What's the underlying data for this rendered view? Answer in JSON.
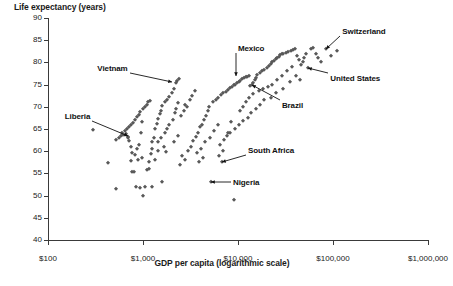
{
  "chart_data": {
    "type": "scatter",
    "title": "",
    "ylabel": "Life expectancy (years)",
    "xlabel": "GDP per capita (logarithmic scale)",
    "x_scale": "log",
    "xlim": [
      100,
      1000000
    ],
    "ylim": [
      40,
      90
    ],
    "grid": false,
    "legend": "none",
    "xticks": [
      "$100",
      "$1,000",
      "$10,000",
      "$100,000",
      "$1,000,000"
    ],
    "xtick_values": [
      100,
      1000,
      10000,
      100000,
      1000000
    ],
    "yticks": [
      "90",
      "85",
      "80",
      "75",
      "70",
      "65",
      "60",
      "55",
      "50",
      "45",
      "40"
    ],
    "ytick_values": [
      90,
      85,
      80,
      75,
      70,
      65,
      60,
      55,
      50,
      45,
      40
    ],
    "marker": "diamond",
    "marker_color": "#595959",
    "axis_color": "#3a3a3a",
    "annotations": [
      {
        "label": "Switzerland",
        "x": 85000,
        "y": 83.0
      },
      {
        "label": "United States",
        "x": 55000,
        "y": 78.8
      },
      {
        "label": "Mexico",
        "x": 9500,
        "y": 77.0
      },
      {
        "label": "Vietnam",
        "x": 2000,
        "y": 75.6
      },
      {
        "label": "Brazil",
        "x": 14000,
        "y": 75.0
      },
      {
        "label": "Liberia",
        "x": 700,
        "y": 63.5
      },
      {
        "label": "South Africa",
        "x": 6800,
        "y": 57.5
      },
      {
        "label": "Nigeria",
        "x": 5200,
        "y": 53.0
      }
    ],
    "points": [
      [
        620,
        63.6
      ],
      [
        300,
        64.7
      ],
      [
        430,
        57.3
      ],
      [
        520,
        51.4
      ],
      [
        700,
        63.2
      ],
      [
        690,
        62.9
      ],
      [
        660,
        63.8
      ],
      [
        705,
        62.2
      ],
      [
        740,
        61.0
      ],
      [
        760,
        55.4
      ],
      [
        800,
        55.3
      ],
      [
        770,
        59.6
      ],
      [
        830,
        59.2
      ],
      [
        860,
        60.4
      ],
      [
        900,
        61.5
      ],
      [
        950,
        64.0
      ],
      [
        980,
        66.5
      ],
      [
        1000,
        50.0
      ],
      [
        1050,
        51.9
      ],
      [
        1100,
        55.8
      ],
      [
        1150,
        56.0
      ],
      [
        1200,
        59.3
      ],
      [
        1250,
        62.0
      ],
      [
        1300,
        63.0
      ],
      [
        1350,
        64.9
      ],
      [
        1400,
        66.2
      ],
      [
        1450,
        67.2
      ],
      [
        1500,
        68.4
      ],
      [
        1550,
        69.1
      ],
      [
        1600,
        70.2
      ],
      [
        1700,
        71.0
      ],
      [
        1800,
        71.6
      ],
      [
        1900,
        72.2
      ],
      [
        2000,
        73.0
      ],
      [
        2100,
        74.0
      ],
      [
        2200,
        75.4
      ],
      [
        2300,
        75.9
      ],
      [
        2400,
        76.2
      ],
      [
        520,
        62.5
      ],
      [
        560,
        63.0
      ],
      [
        580,
        63.4
      ],
      [
        600,
        64.2
      ],
      [
        640,
        64.6
      ],
      [
        680,
        65.0
      ],
      [
        720,
        65.4
      ],
      [
        750,
        66.0
      ],
      [
        790,
        66.3
      ],
      [
        820,
        67.0
      ],
      [
        870,
        67.6
      ],
      [
        910,
        68.2
      ],
      [
        940,
        68.8
      ],
      [
        990,
        69.4
      ],
      [
        1040,
        70.0
      ],
      [
        1090,
        70.5
      ],
      [
        1140,
        71.0
      ],
      [
        1190,
        71.4
      ],
      [
        850,
        52.0
      ],
      [
        920,
        51.8
      ],
      [
        1250,
        52.0
      ],
      [
        1600,
        53.0
      ],
      [
        5200,
        53.0
      ],
      [
        6800,
        57.5
      ],
      [
        9000,
        49.0
      ],
      [
        2600,
        59.0
      ],
      [
        3000,
        60.0
      ],
      [
        3200,
        61.0
      ],
      [
        3400,
        62.4
      ],
      [
        3600,
        63.2
      ],
      [
        3800,
        64.0
      ],
      [
        4000,
        65.5
      ],
      [
        4200,
        66.0
      ],
      [
        4400,
        67.0
      ],
      [
        4600,
        68.0
      ],
      [
        4800,
        69.0
      ],
      [
        5000,
        70.0
      ],
      [
        5400,
        71.0
      ],
      [
        5800,
        71.5
      ],
      [
        6200,
        72.0
      ],
      [
        6600,
        72.6
      ],
      [
        7000,
        73.0
      ],
      [
        7400,
        73.4
      ],
      [
        7800,
        73.8
      ],
      [
        8200,
        74.2
      ],
      [
        8600,
        74.5
      ],
      [
        9000,
        74.8
      ],
      [
        9400,
        75.0
      ],
      [
        9800,
        75.3
      ],
      [
        10200,
        75.6
      ],
      [
        10600,
        75.9
      ],
      [
        11000,
        76.2
      ],
      [
        11500,
        76.4
      ],
      [
        12000,
        76.6
      ],
      [
        12500,
        76.8
      ],
      [
        13000,
        77.0
      ],
      [
        13500,
        74.6
      ],
      [
        14000,
        75.0
      ],
      [
        14500,
        75.4
      ],
      [
        15000,
        76.0
      ],
      [
        15500,
        76.5
      ],
      [
        16000,
        77.2
      ],
      [
        17000,
        77.6
      ],
      [
        18000,
        78.0
      ],
      [
        19000,
        78.4
      ],
      [
        20000,
        78.8
      ],
      [
        21000,
        79.2
      ],
      [
        22000,
        79.6
      ],
      [
        23000,
        80.0
      ],
      [
        24000,
        80.4
      ],
      [
        25000,
        80.8
      ],
      [
        26000,
        81.0
      ],
      [
        27000,
        81.3
      ],
      [
        28000,
        81.6
      ],
      [
        29000,
        81.8
      ],
      [
        30000,
        82.0
      ],
      [
        32000,
        82.2
      ],
      [
        34000,
        82.4
      ],
      [
        36000,
        82.6
      ],
      [
        38000,
        82.8
      ],
      [
        40000,
        83.0
      ],
      [
        42000,
        81.5
      ],
      [
        44000,
        80.5
      ],
      [
        46000,
        79.5
      ],
      [
        48000,
        80.0
      ],
      [
        50000,
        81.0
      ],
      [
        52000,
        82.0
      ],
      [
        55000,
        78.8
      ],
      [
        58000,
        83.0
      ],
      [
        62000,
        83.2
      ],
      [
        66000,
        82.0
      ],
      [
        70000,
        81.0
      ],
      [
        75000,
        80.0
      ],
      [
        85000,
        83.0
      ],
      [
        95000,
        81.5
      ],
      [
        110000,
        82.5
      ],
      [
        2800,
        70.5
      ],
      [
        3100,
        71.5
      ],
      [
        3300,
        72.5
      ],
      [
        3500,
        73.5
      ],
      [
        2500,
        68.0
      ],
      [
        2700,
        69.0
      ],
      [
        2900,
        70.0
      ],
      [
        1900,
        66.0
      ],
      [
        2050,
        67.0
      ],
      [
        2150,
        68.5
      ],
      [
        2250,
        69.5
      ],
      [
        2350,
        70.8
      ],
      [
        1700,
        64.0
      ],
      [
        1800,
        65.0
      ],
      [
        1450,
        62.0
      ],
      [
        1550,
        63.0
      ],
      [
        1650,
        61.0
      ],
      [
        3700,
        59.5
      ],
      [
        4100,
        60.5
      ],
      [
        4500,
        62.0
      ],
      [
        5100,
        63.0
      ],
      [
        5600,
        64.5
      ],
      [
        6100,
        66.0
      ],
      [
        6500,
        61.5
      ],
      [
        7200,
        62.5
      ],
      [
        7900,
        64.0
      ],
      [
        8400,
        66.5
      ],
      [
        2450,
        57.0
      ],
      [
        2750,
        58.0
      ],
      [
        3900,
        57.5
      ],
      [
        4300,
        58.5
      ],
      [
        10500,
        69.0
      ],
      [
        11200,
        70.0
      ],
      [
        12200,
        71.0
      ],
      [
        13200,
        72.0
      ],
      [
        14500,
        72.8
      ],
      [
        16500,
        73.5
      ],
      [
        18500,
        74.0
      ],
      [
        20500,
        74.5
      ],
      [
        23000,
        75.0
      ],
      [
        26000,
        76.0
      ],
      [
        29000,
        77.0
      ],
      [
        33000,
        78.0
      ],
      [
        37000,
        79.0
      ],
      [
        41000,
        77.0
      ],
      [
        45000,
        76.0
      ],
      [
        30000,
        74.0
      ],
      [
        35000,
        75.5
      ],
      [
        25000,
        73.0
      ],
      [
        22000,
        72.0
      ],
      [
        19000,
        71.5
      ],
      [
        17000,
        70.5
      ],
      [
        15500,
        69.5
      ],
      [
        13800,
        68.5
      ],
      [
        12600,
        67.5
      ],
      [
        11400,
        66.8
      ],
      [
        10200,
        66.0
      ],
      [
        9200,
        65.0
      ],
      [
        8300,
        64.2
      ],
      [
        7600,
        63.5
      ],
      [
        6900,
        60.0
      ],
      [
        6300,
        59.0
      ],
      [
        1350,
        58.0
      ],
      [
        1150,
        57.5
      ],
      [
        980,
        58.5
      ],
      [
        880,
        58.0
      ],
      [
        740,
        57.8
      ],
      [
        1250,
        60.5
      ],
      [
        1450,
        60.0
      ],
      [
        1750,
        59.8
      ],
      [
        2100,
        62.0
      ],
      [
        2350,
        63.5
      ]
    ]
  }
}
